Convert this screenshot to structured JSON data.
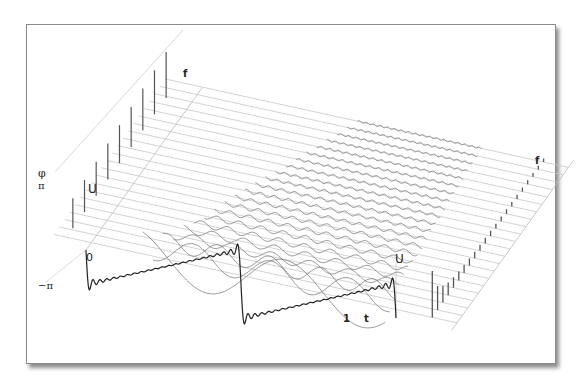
{
  "diagram": {
    "labels": {
      "time_axis": "t",
      "time_origin": "0",
      "time_end": "1",
      "freq_axis_phase_plane": "f",
      "freq_axis_amplitude_plane": "f",
      "phase_axis": "φ",
      "phase_max": "π",
      "phase_min": "−π",
      "amplitude_axis_phase_side": "U",
      "amplitude_axis_amp_side": "U"
    },
    "harmonics_count": 22,
    "colors": {
      "frame_border": "#8a8a8a",
      "grid_line": "#c8c8c8",
      "harmonic_curve": "#6a6a6a",
      "sawtooth": "#222222",
      "spectrum_bar": "#555555"
    }
  },
  "chart_data": {
    "type": "3d-spectrum",
    "signal": "sawtooth",
    "x_axis": {
      "label": "t",
      "ticks": [
        "0",
        "1"
      ],
      "periods_shown": 2
    },
    "depth_axis": {
      "label": "f"
    },
    "amplitude_spectrum": {
      "label": "U",
      "values": [
        1.0,
        0.5,
        0.333,
        0.25,
        0.2,
        0.167,
        0.143,
        0.125,
        0.111,
        0.1,
        0.091,
        0.083,
        0.077,
        0.071,
        0.067,
        0.063,
        0.059,
        0.056,
        0.053,
        0.05,
        0.048,
        0.045
      ]
    },
    "phase_spectrum": {
      "label": "φ",
      "range": [
        "−π",
        "π"
      ]
    }
  }
}
